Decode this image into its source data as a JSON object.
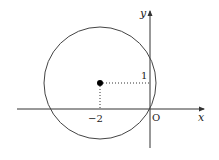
{
  "diagram": {
    "type": "coordinate-plane-circle",
    "axes": {
      "x_label": "x",
      "y_label": "y",
      "origin_label": "O"
    },
    "circle": {
      "center": [
        -2,
        1
      ],
      "passes_through_origin": true
    },
    "tick_labels": {
      "x_center": "−2",
      "y_center": "1"
    },
    "colors": {
      "stroke": "#333333",
      "point": "#000000",
      "background": "#ffffff"
    }
  }
}
